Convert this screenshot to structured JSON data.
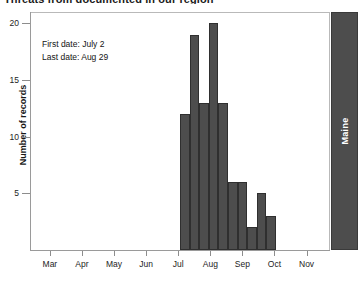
{
  "title": "Threats from documented in our region",
  "annotation": {
    "first_date_label": "First date: July 2",
    "last_date_label": "Last date: Aug 29"
  },
  "panel": {
    "label": "Maine",
    "color": "#4d4d4d",
    "text_color": "#ffffff"
  },
  "chart_data": {
    "type": "bar",
    "title": "Threats from documented in our region",
    "xlabel": "",
    "ylabel": "Number of records",
    "ylim": [
      0,
      21
    ],
    "yticks": [
      5,
      10,
      15,
      20
    ],
    "ytick_labels": [
      "5",
      "10",
      "15",
      "20"
    ],
    "xtick_labels": [
      "Mar",
      "Apr",
      "May",
      "Jun",
      "Jul",
      "Aug",
      "Sep",
      "Oct",
      "Nov"
    ],
    "grid": false,
    "legend": "none",
    "bar_color": "#4d4d4d",
    "bar_edge_color": "#2f2f2f",
    "categories": [
      "Jul wk1",
      "Jul wk2",
      "Jul wk3",
      "Jul wk4",
      "Aug wk1",
      "Aug wk2",
      "Aug wk3",
      "Aug wk4",
      "Aug wk5",
      "Sep wk1"
    ],
    "values": [
      12,
      19,
      13,
      20,
      13,
      6,
      6,
      2,
      5,
      3
    ],
    "first_date": "July 2",
    "last_date": "Aug 29"
  }
}
